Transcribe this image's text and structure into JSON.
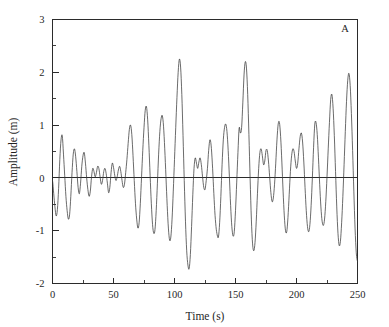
{
  "figure": {
    "panel_label": "A",
    "background_color": "#ffffff",
    "line_color": "#3a3a3a",
    "axis_color": "#2b2b2b"
  },
  "chart_data": {
    "type": "line",
    "title": "",
    "subtitle": "",
    "xlabel": "Time (s)",
    "ylabel": "Amplitude (m)",
    "xlim": [
      0,
      250
    ],
    "ylim": [
      -2,
      3
    ],
    "xticks": [
      0,
      50,
      100,
      150,
      200,
      250
    ],
    "xticklabels": [
      "0",
      "50",
      "100",
      "150",
      "200",
      "250"
    ],
    "xminorticks": [
      25,
      75,
      125,
      175,
      225
    ],
    "yticks": [
      -2,
      -1,
      0,
      1,
      2,
      3
    ],
    "yticklabels": [
      "-2",
      "-1",
      "0",
      "1",
      "2",
      "3"
    ],
    "yminorticks": [
      -1.5,
      -0.5,
      0.5,
      1.5,
      2.5
    ],
    "grid": false,
    "legend": null,
    "annotations": [
      {
        "text": "A",
        "position": "top-right"
      }
    ],
    "zero_reference_line": 0,
    "series": [
      {
        "name": "wave elevation",
        "x": [
          0.0,
          1.0,
          2.0,
          3.0,
          4.0,
          5.0,
          6.0,
          7.0,
          8.0,
          9.0,
          10.0,
          11.0,
          12.0,
          13.0,
          14.0,
          15.0,
          16.0,
          17.0,
          18.0,
          19.0,
          20.0,
          21.0,
          22.0,
          23.0,
          24.0,
          25.0,
          26.0,
          27.0,
          28.0,
          29.0,
          30.0,
          31.0,
          32.0,
          33.0,
          34.0,
          35.0,
          36.0,
          37.0,
          38.0,
          39.0,
          40.0,
          41.0,
          42.0,
          43.0,
          44.0,
          45.0,
          46.0,
          47.0,
          48.0,
          49.0,
          50.0,
          51.0,
          52.0,
          53.0,
          54.0,
          55.0,
          56.0,
          57.0,
          58.0,
          59.0,
          60.0,
          61.0,
          62.0,
          63.0,
          64.0,
          65.0,
          66.0,
          67.0,
          68.0,
          69.0,
          70.0,
          71.0,
          72.0,
          73.0,
          74.0,
          75.0,
          76.0,
          77.0,
          78.0,
          79.0,
          80.0,
          81.0,
          82.0,
          83.0,
          84.0,
          85.0,
          86.0,
          87.0,
          88.0,
          89.0,
          90.0,
          91.0,
          92.0,
          93.0,
          94.0,
          95.0,
          96.0,
          97.0,
          98.0,
          99.0,
          100.0,
          101.0,
          102.0,
          103.0,
          104.0,
          105.0,
          106.0,
          107.0,
          108.0,
          109.0,
          110.0,
          111.0,
          112.0,
          113.0,
          114.0,
          115.0,
          116.0,
          117.0,
          118.0,
          119.0,
          120.0,
          121.0,
          122.0,
          123.0,
          124.0,
          125.0,
          126.0,
          127.0,
          128.0,
          129.0,
          130.0,
          131.0,
          132.0,
          133.0,
          134.0,
          135.0,
          136.0,
          137.0,
          138.0,
          139.0,
          140.0,
          141.0,
          142.0,
          143.0,
          144.0,
          145.0,
          146.0,
          147.0,
          148.0,
          149.0,
          150.0,
          151.0,
          152.0,
          153.0,
          154.0,
          155.0,
          156.0,
          157.0,
          158.0,
          159.0,
          160.0,
          161.0,
          162.0,
          163.0,
          164.0,
          165.0,
          166.0,
          167.0,
          168.0,
          169.0,
          170.0,
          171.0,
          172.0,
          173.0,
          174.0,
          175.0,
          176.0,
          177.0,
          178.0,
          179.0,
          180.0,
          181.0,
          182.0,
          183.0,
          184.0,
          185.0,
          186.0,
          187.0,
          188.0,
          189.0,
          190.0,
          191.0,
          192.0,
          193.0,
          194.0,
          195.0,
          196.0,
          197.0,
          198.0,
          199.0,
          200.0,
          201.0,
          202.0,
          203.0,
          204.0,
          205.0,
          206.0,
          207.0,
          208.0,
          209.0,
          210.0,
          211.0,
          212.0,
          213.0,
          214.0,
          215.0,
          216.0,
          217.0,
          218.0,
          219.0,
          220.0,
          221.0,
          222.0,
          223.0,
          224.0,
          225.0,
          226.0,
          227.0,
          228.0,
          229.0,
          230.0,
          231.0,
          232.0,
          233.0,
          234.0,
          235.0,
          236.0,
          237.0,
          238.0,
          239.0,
          240.0,
          241.0,
          242.0,
          243.0,
          244.0,
          245.0,
          246.0,
          247.0,
          248.0,
          249.0,
          250.0
        ],
        "y": [
          -0.05,
          -0.3,
          -0.55,
          -0.72,
          -0.6,
          -0.2,
          0.35,
          0.72,
          0.8,
          0.45,
          0.05,
          -0.35,
          -0.62,
          -0.78,
          -0.7,
          -0.35,
          0.1,
          0.45,
          0.55,
          0.4,
          0.12,
          -0.18,
          -0.3,
          -0.1,
          0.22,
          0.42,
          0.48,
          0.28,
          0.0,
          -0.22,
          -0.35,
          -0.25,
          0.02,
          0.18,
          0.12,
          0.02,
          0.1,
          0.22,
          0.18,
          0.02,
          -0.12,
          -0.05,
          0.12,
          0.18,
          0.08,
          -0.1,
          -0.28,
          -0.18,
          0.1,
          0.28,
          0.2,
          0.05,
          -0.05,
          0.02,
          0.15,
          0.22,
          0.12,
          -0.05,
          -0.18,
          -0.12,
          0.1,
          0.35,
          0.65,
          0.92,
          1.0,
          0.82,
          0.42,
          -0.05,
          -0.48,
          -0.78,
          -0.95,
          -0.85,
          -0.48,
          0.02,
          0.52,
          0.95,
          1.28,
          1.35,
          1.1,
          0.62,
          0.05,
          -0.48,
          -0.88,
          -1.05,
          -0.98,
          -0.62,
          -0.1,
          0.45,
          0.88,
          1.12,
          1.18,
          0.98,
          0.55,
          0.02,
          -0.52,
          -0.95,
          -1.18,
          -1.12,
          -0.78,
          -0.25,
          0.35,
          0.95,
          1.52,
          2.0,
          2.25,
          2.1,
          1.58,
          0.8,
          -0.05,
          -0.82,
          -1.38,
          -1.65,
          -1.72,
          -1.45,
          -0.92,
          -0.32,
          0.18,
          0.38,
          0.28,
          0.18,
          0.3,
          0.38,
          0.25,
          0.02,
          -0.18,
          -0.22,
          -0.05,
          0.18,
          0.52,
          0.72,
          0.62,
          0.28,
          -0.18,
          -0.62,
          -0.92,
          -1.08,
          -1.12,
          -0.85,
          -0.35,
          0.25,
          0.72,
          0.95,
          1.02,
          0.88,
          0.52,
          0.02,
          -0.52,
          -0.92,
          -1.1,
          -1.02,
          -0.62,
          -0.08,
          0.48,
          0.95,
          0.85,
          0.95,
          1.42,
          1.95,
          2.2,
          2.08,
          1.58,
          0.82,
          -0.02,
          -0.78,
          -1.25,
          -1.38,
          -1.22,
          -0.82,
          -0.3,
          0.18,
          0.48,
          0.55,
          0.42,
          0.25,
          0.32,
          0.52,
          0.52,
          0.32,
          0.02,
          -0.28,
          -0.45,
          -0.38,
          -0.12,
          0.28,
          0.72,
          1.02,
          1.05,
          0.78,
          0.3,
          -0.25,
          -0.72,
          -1.0,
          -1.02,
          -0.75,
          -0.32,
          0.12,
          0.42,
          0.55,
          0.5,
          0.32,
          0.18,
          0.28,
          0.55,
          0.78,
          0.85,
          0.68,
          0.3,
          -0.18,
          -0.62,
          -0.92,
          -1.02,
          -0.88,
          -0.52,
          0.0,
          0.58,
          1.02,
          1.05,
          0.82,
          0.38,
          -0.12,
          -0.55,
          -0.82,
          -0.9,
          -0.78,
          -0.45,
          0.02,
          0.55,
          1.05,
          1.48,
          1.58,
          1.32,
          0.8,
          0.12,
          -0.55,
          -1.05,
          -1.28,
          -1.2,
          -0.85,
          -0.35,
          0.25,
          0.88,
          1.45,
          1.85,
          1.98,
          1.75,
          1.22,
          0.52,
          -0.25,
          -0.95,
          -1.42,
          -1.58
        ],
        "y_extended": [
          0.0
        ],
        "note": "irregular random sea-state time series"
      }
    ],
    "data_summary": {
      "max_value": 2.37,
      "min_value": -1.78,
      "mean_value": 0.0,
      "n_points": 251,
      "sampling_interval_s": 1.0
    }
  }
}
